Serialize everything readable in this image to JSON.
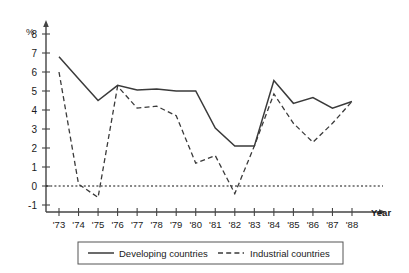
{
  "chart_data": {
    "type": "line",
    "title": "",
    "xlabel": "Year",
    "ylabel": "%",
    "unit_label": "%",
    "axis_name_x": "Year",
    "grid": false,
    "legend_position": "bottom",
    "categories": [
      "'73",
      "'74",
      "'75",
      "'76",
      "'77",
      "'78",
      "'79",
      "'80",
      "'81",
      "'82",
      "'83",
      "'84",
      "'85",
      "'86",
      "'87",
      "'88"
    ],
    "x": [
      1973,
      1974,
      1975,
      1976,
      1977,
      1978,
      1979,
      1980,
      1981,
      1982,
      1983,
      1984,
      1985,
      1986,
      1987,
      1988
    ],
    "xlim": [
      1973,
      1988
    ],
    "ylim": [
      -1,
      8
    ],
    "ytick_labels": [
      "8",
      "7",
      "6",
      "5",
      "4",
      "3",
      "2",
      "1",
      "0",
      "-1"
    ],
    "ytick_values": [
      8,
      7,
      6,
      5,
      4,
      3,
      2,
      1,
      0,
      -1
    ],
    "zero_reference_line": 0,
    "series": [
      {
        "name": "Developing countries",
        "style": "solid",
        "color": "#3a3a3a",
        "values": [
          6.8,
          5.65,
          4.5,
          5.3,
          5.05,
          5.1,
          5.0,
          5.0,
          3.05,
          2.1,
          2.1,
          5.55,
          4.35,
          4.65,
          4.1,
          4.45
        ]
      },
      {
        "name": "Industrial countries",
        "style": "dashed",
        "color": "#3a3a3a",
        "values": [
          6.0,
          0.1,
          -0.6,
          5.25,
          4.1,
          4.2,
          3.7,
          1.2,
          1.6,
          -0.4,
          2.1,
          4.85,
          3.3,
          2.3,
          3.3,
          4.45
        ]
      }
    ]
  },
  "legend": {
    "items": [
      {
        "label": "Developing countries",
        "style": "solid"
      },
      {
        "label": "Industrial countries",
        "style": "dashed"
      }
    ]
  }
}
